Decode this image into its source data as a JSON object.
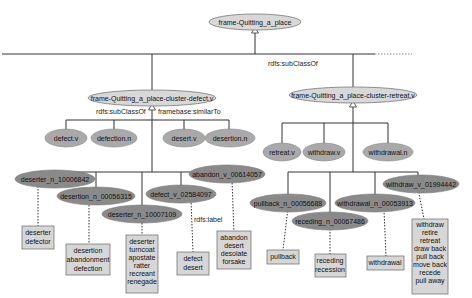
{
  "root": {
    "label": "frame-Quitting_a_place"
  },
  "edge_labels": {
    "subclass_right": "rdfs:subClassOf",
    "subclass_left": "rdfs:subClassOf",
    "similar_to": "framebase:similarTo",
    "rdfs_label": "rdfs:label"
  },
  "clusters": [
    {
      "label": "frame-Quitting_a_place-cluster-defect.v",
      "lexical_units": [
        "defect.v",
        "defection.n",
        "desert.v",
        "desertion.n"
      ],
      "synsets": [
        {
          "label": "deserter_n_10006842",
          "lemmas": [
            "deserter",
            "defector"
          ]
        },
        {
          "label": "desertion_n_00056315",
          "lemmas": [
            "desertion",
            "abandonment",
            "defection"
          ]
        },
        {
          "label": "deserter_n_10007109",
          "lemmas": [
            "deserter",
            "turncoat",
            "apostate",
            "ratter",
            "recreant",
            "renegade"
          ]
        },
        {
          "label": "defect_v_02584097",
          "lemmas": [
            "defect",
            "desert"
          ]
        },
        {
          "label": "abandon_v_00614057",
          "lemmas": [
            "abandon",
            "desert",
            "desolate",
            "forsake"
          ]
        }
      ]
    },
    {
      "label": "frame-Quitting_a_place-cluster-retreat.v",
      "lexical_units": [
        "retreat.v",
        "withdraw.v",
        "withdrawal.n"
      ],
      "synsets": [
        {
          "label": "pullback_n_00056688",
          "lemmas": [
            "pullback"
          ]
        },
        {
          "label": "receding_n_00067486",
          "lemmas": [
            "receding",
            "recession"
          ]
        },
        {
          "label": "withdrawal_n_00053913",
          "lemmas": [
            "withdrawal"
          ]
        },
        {
          "label": "withdraw_v_01994442",
          "lemmas": [
            "withdraw",
            "retire",
            "retreat",
            "draw back",
            "pull back",
            "move back",
            "recede",
            "pull away"
          ]
        }
      ]
    }
  ],
  "colors": {
    "frame_fill": "#d8d8d8",
    "lexical_unit_fill": "#a9a9a9",
    "synset_fill": "#8a8a8a",
    "lemma_box_fill": "#d6d6d6",
    "edge": "#333333"
  }
}
